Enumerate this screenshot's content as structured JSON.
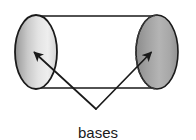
{
  "figure": {
    "background_color": "#ffffff",
    "stroke_color": "#1a1a1a",
    "width": 196,
    "height": 140
  },
  "shape": {
    "name": "cylinder",
    "body": {
      "top_edge": {
        "x1": 38,
        "y1": 16,
        "x2": 158,
        "y2": 16
      },
      "bottom_edge": {
        "x1": 38,
        "y1": 88,
        "x2": 158,
        "y2": 88
      }
    },
    "bases": [
      {
        "id": "left-base",
        "position": "left",
        "center_x": 36,
        "center_y": 52,
        "radius_x": 21,
        "radius_y": 37,
        "edge_style": "solid",
        "fill_light": "#e8e8e8",
        "fill_dark": "#9a9a9a"
      },
      {
        "id": "right-base",
        "position": "right",
        "center_x": 157,
        "center_y": 52,
        "radius_x": 21,
        "radius_y": 37,
        "edge_style": "dashed-hidden-edge",
        "fill_light": "#b8b8b8",
        "fill_dark": "#8a8a8a"
      }
    ]
  },
  "annotation": {
    "label": "bases",
    "label_x": 98,
    "label_y": 133,
    "junction": {
      "x": 96,
      "y": 109
    },
    "leaders": [
      {
        "id": "leader-left",
        "from_x": 96,
        "from_y": 109,
        "to_x": 33,
        "to_y": 51,
        "arrowhead": "up-left"
      },
      {
        "id": "leader-right",
        "from_x": 96,
        "from_y": 109,
        "to_x": 152,
        "to_y": 51,
        "arrowhead": "up-right"
      }
    ]
  }
}
